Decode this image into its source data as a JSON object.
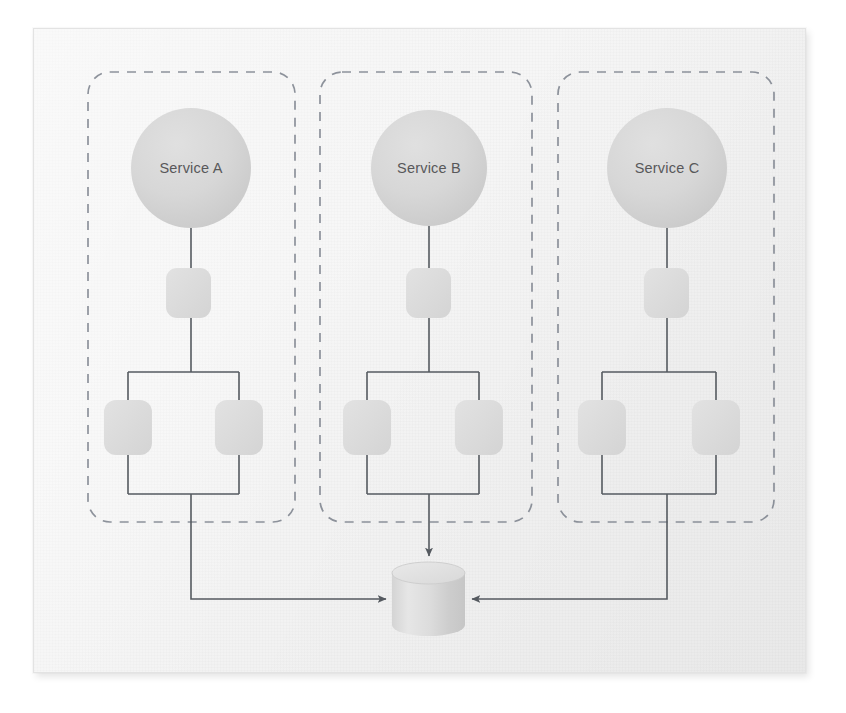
{
  "diagram": {
    "title_visible": false,
    "background_color": "#f3f3f3",
    "frame": {
      "x": 33,
      "y": 28,
      "width": 773,
      "height": 645,
      "border_color": "#e3e3e3"
    },
    "palette": {
      "node_fill": "#d8d8d8",
      "node_fill_dark": "#cfcfcf",
      "box_fill": "#dcdcdc",
      "line_color": "#555a60",
      "dashed_border_color": "#6f7682",
      "label_color": "#58585a",
      "cylinder_fill": "#dedede"
    },
    "groups": [
      {
        "id": "group-a",
        "label": "Service A",
        "container": {
          "x": 88,
          "y": 72,
          "width": 207,
          "height": 450,
          "radius": 22,
          "dashed": true
        },
        "circle": {
          "cx": 191,
          "cy": 168,
          "r": 60
        },
        "middle_box": {
          "x": 166,
          "y": 268,
          "width": 45,
          "height": 50,
          "radius": 11
        },
        "leaf_boxes": [
          {
            "x": 104,
            "y": 400,
            "width": 48,
            "height": 55,
            "radius": 12
          },
          {
            "x": 215,
            "y": 400,
            "width": 48,
            "height": 55,
            "radius": 12
          }
        ],
        "split": {
          "y": 372,
          "left_x": 128,
          "right_x": 239,
          "rejoin_y": 494
        },
        "route_to_db": "down-then-right"
      },
      {
        "id": "group-b",
        "label": "Service B",
        "container": {
          "x": 320,
          "y": 72,
          "width": 212,
          "height": 450,
          "radius": 22,
          "dashed": true
        },
        "circle": {
          "cx": 429,
          "cy": 168,
          "r": 58
        },
        "middle_box": {
          "x": 406,
          "y": 268,
          "width": 45,
          "height": 50,
          "radius": 11
        },
        "leaf_boxes": [
          {
            "x": 343,
            "y": 400,
            "width": 48,
            "height": 55,
            "radius": 12
          },
          {
            "x": 455,
            "y": 400,
            "width": 48,
            "height": 55,
            "radius": 12
          }
        ],
        "split": {
          "y": 372,
          "left_x": 367,
          "right_x": 479,
          "rejoin_y": 494
        },
        "route_to_db": "straight-down"
      },
      {
        "id": "group-c",
        "label": "Service C",
        "container": {
          "x": 558,
          "y": 72,
          "width": 216,
          "height": 450,
          "radius": 22,
          "dashed": true
        },
        "circle": {
          "cx": 667,
          "cy": 168,
          "r": 60
        },
        "middle_box": {
          "x": 644,
          "y": 268,
          "width": 45,
          "height": 50,
          "radius": 11
        },
        "leaf_boxes": [
          {
            "x": 578,
            "y": 400,
            "width": 48,
            "height": 55,
            "radius": 12
          },
          {
            "x": 692,
            "y": 400,
            "width": 48,
            "height": 55,
            "radius": 12
          }
        ],
        "split": {
          "y": 372,
          "left_x": 602,
          "right_x": 716,
          "rejoin_y": 494
        },
        "route_to_db": "down-then-left"
      }
    ],
    "database": {
      "name": "shared-datastore",
      "label": "",
      "x": 392,
      "y": 562,
      "width": 73,
      "height": 74,
      "ellipse_ry": 11
    },
    "arrows": [
      {
        "from": "group-a",
        "to": "shared-datastore",
        "direction": "right",
        "waypoints": [
          [
            191,
            494
          ],
          [
            191,
            599
          ],
          [
            388,
            599
          ]
        ]
      },
      {
        "from": "group-b",
        "to": "shared-datastore",
        "direction": "down",
        "waypoints": [
          [
            429,
            494
          ],
          [
            429,
            558
          ]
        ]
      },
      {
        "from": "group-c",
        "to": "shared-datastore",
        "direction": "left",
        "waypoints": [
          [
            667,
            494
          ],
          [
            667,
            599
          ],
          [
            470,
            599
          ]
        ]
      }
    ]
  }
}
